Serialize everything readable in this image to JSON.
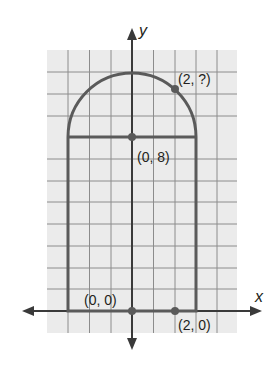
{
  "figure": {
    "axes": {
      "x_label": "x",
      "y_label": "y"
    },
    "points": [
      {
        "label": "(2, ?)",
        "x": 2,
        "y": null
      },
      {
        "label": "(0, 8)",
        "x": 0,
        "y": 8
      },
      {
        "label": "(0, 0)",
        "x": 0,
        "y": 0
      },
      {
        "label": "(2, 0)",
        "x": 2,
        "y": 0
      }
    ],
    "shape": {
      "description": "Rectangle of width 6 and height 8 topped by a semicircle of radius 3 centered at (0, 8)",
      "rect_x_range": [
        -3,
        3
      ],
      "rect_y_range": [
        0,
        8
      ],
      "semicircle_center": [
        0,
        8
      ],
      "semicircle_radius": 3
    },
    "colors": {
      "grid_bg": "#ebebeb",
      "grid_line": "#8c8c8c",
      "shape": "#5a5a5a",
      "axis": "#3a3a3a"
    }
  }
}
